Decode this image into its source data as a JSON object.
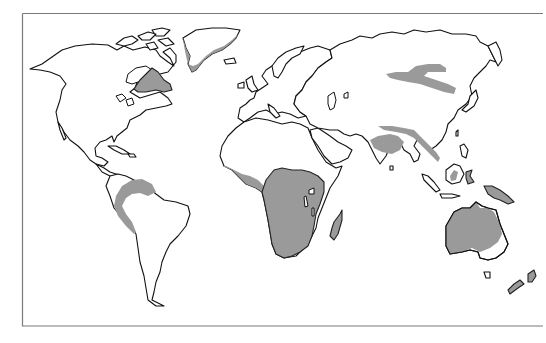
{
  "map": {
    "type": "world-outline",
    "projection": "equirectangular-like",
    "frame": {
      "x": 22,
      "y": 13,
      "width": 522,
      "height": 313,
      "stroke": "#7a7a7a"
    },
    "colors": {
      "background": "#ffffff",
      "land_fill": "#ffffff",
      "coastline": "#111111",
      "highlight_fill": "#9a9a9a"
    },
    "shaded_regions": [
      {
        "id": "greenland-margin",
        "label": "Greenland (east/south coast)"
      },
      {
        "id": "canadian-shield",
        "label": "Canada (Hudson Bay / Quebec)"
      },
      {
        "id": "amazon",
        "label": "Northern South America (Amazon / Andes foothills)"
      },
      {
        "id": "west-africa",
        "label": "West Africa coast"
      },
      {
        "id": "central-southern-africa",
        "label": "Central & Southern Africa"
      },
      {
        "id": "madagascar",
        "label": "Madagascar"
      },
      {
        "id": "siberia-mongolia",
        "label": "Southern Siberia / Mongolia"
      },
      {
        "id": "india-ganges",
        "label": "Northern India (Ganges plain)"
      },
      {
        "id": "himalaya-indochina",
        "label": "Himalayan foothills / Indochina"
      },
      {
        "id": "borneo",
        "label": "Borneo (interior)"
      },
      {
        "id": "new-guinea",
        "label": "New Guinea"
      },
      {
        "id": "sulawesi",
        "label": "Sulawesi"
      },
      {
        "id": "australia",
        "label": "Australia (west & interior)"
      },
      {
        "id": "new-zealand",
        "label": "New Zealand"
      }
    ]
  }
}
